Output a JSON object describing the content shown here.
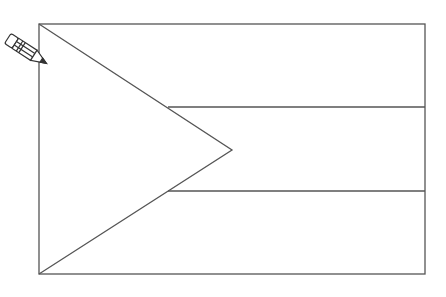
{
  "figure": {
    "stroke_color": "#555555",
    "background": "#ffffff",
    "flag": {
      "x": 39,
      "y": 24,
      "width": 386,
      "height": 250
    },
    "stripes": 3,
    "triangle_tip": {
      "x": 232,
      "y": 150
    }
  },
  "icons": {
    "pencil": "pencil-icon"
  }
}
